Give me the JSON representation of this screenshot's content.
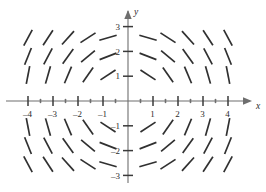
{
  "figure": {
    "kind": "slope-field",
    "axis_x_label": "x",
    "axis_y_label": "y",
    "line_color": "#303030",
    "axis_color": "#6e6e6e"
  },
  "chart_data": {
    "type": "scatter",
    "title": "",
    "xlabel": "x",
    "ylabel": "y",
    "xlim": [
      -4.7,
      4.7
    ],
    "ylim": [
      -3.4,
      3.4
    ],
    "grid": false,
    "legend": null,
    "xticks": [
      -4,
      -3,
      -2,
      -1,
      1,
      2,
      3,
      4
    ],
    "xtick_labels": [
      "–4",
      "–3",
      "–2",
      "–1",
      "1",
      "2",
      "3",
      "4"
    ],
    "yticks": [
      3,
      2,
      1,
      -1,
      -2,
      -3
    ],
    "ytick_labels": [
      "3",
      "2",
      "1",
      "–1",
      "–2",
      "–3"
    ],
    "minor_xticks": [
      -3.5,
      -2.5,
      -1.5,
      -0.5,
      0.5,
      1.5,
      2.5,
      3.5
    ],
    "field_x": [
      -4.0,
      -3.2,
      -2.4,
      -1.6,
      -0.8,
      0.8,
      1.6,
      2.4,
      3.2,
      4.0
    ],
    "field_y": [
      2.55,
      1.8,
      1.05,
      -1.05,
      -1.8,
      -2.55
    ],
    "slope_expression": "dy/dx = -x*y",
    "segment_length": 18,
    "segments": [
      {
        "x": -4.0,
        "y": 2.55,
        "angle_deg": -62
      },
      {
        "x": -3.2,
        "y": 2.55,
        "angle_deg": -57
      },
      {
        "x": -2.4,
        "y": 2.55,
        "angle_deg": -48
      },
      {
        "x": -1.6,
        "y": 2.55,
        "angle_deg": -33
      },
      {
        "x": -0.8,
        "y": 2.55,
        "angle_deg": -16
      },
      {
        "x": 0.8,
        "y": 2.55,
        "angle_deg": 16
      },
      {
        "x": 1.6,
        "y": 2.55,
        "angle_deg": 33
      },
      {
        "x": 2.4,
        "y": 2.55,
        "angle_deg": 48
      },
      {
        "x": 3.2,
        "y": 2.55,
        "angle_deg": 57
      },
      {
        "x": 4.0,
        "y": 2.55,
        "angle_deg": 62
      },
      {
        "x": -4.0,
        "y": 1.8,
        "angle_deg": -68
      },
      {
        "x": -3.2,
        "y": 1.8,
        "angle_deg": -62
      },
      {
        "x": -2.4,
        "y": 1.8,
        "angle_deg": -54
      },
      {
        "x": -1.6,
        "y": 1.8,
        "angle_deg": -40
      },
      {
        "x": -0.8,
        "y": 1.8,
        "angle_deg": -21
      },
      {
        "x": 0.8,
        "y": 1.8,
        "angle_deg": 21
      },
      {
        "x": 1.6,
        "y": 1.8,
        "angle_deg": 40
      },
      {
        "x": 2.4,
        "y": 1.8,
        "angle_deg": 54
      },
      {
        "x": 3.2,
        "y": 1.8,
        "angle_deg": 62
      },
      {
        "x": 4.0,
        "y": 1.8,
        "angle_deg": 68
      },
      {
        "x": -4.0,
        "y": 1.05,
        "angle_deg": -79
      },
      {
        "x": -3.2,
        "y": 1.05,
        "angle_deg": -74
      },
      {
        "x": -2.4,
        "y": 1.05,
        "angle_deg": -67
      },
      {
        "x": -1.6,
        "y": 1.05,
        "angle_deg": -55
      },
      {
        "x": -0.8,
        "y": 1.05,
        "angle_deg": -33
      },
      {
        "x": 0.8,
        "y": 1.05,
        "angle_deg": 33
      },
      {
        "x": 1.6,
        "y": 1.05,
        "angle_deg": 55
      },
      {
        "x": 2.4,
        "y": 1.05,
        "angle_deg": 67
      },
      {
        "x": 3.2,
        "y": 1.05,
        "angle_deg": 74
      },
      {
        "x": 4.0,
        "y": 1.05,
        "angle_deg": 79
      },
      {
        "x": -4.0,
        "y": -1.05,
        "angle_deg": 79
      },
      {
        "x": -3.2,
        "y": -1.05,
        "angle_deg": 74
      },
      {
        "x": -2.4,
        "y": -1.05,
        "angle_deg": 67
      },
      {
        "x": -1.6,
        "y": -1.05,
        "angle_deg": 55
      },
      {
        "x": -0.8,
        "y": -1.05,
        "angle_deg": 33
      },
      {
        "x": 0.8,
        "y": -1.05,
        "angle_deg": -33
      },
      {
        "x": 1.6,
        "y": -1.05,
        "angle_deg": -55
      },
      {
        "x": 2.4,
        "y": -1.05,
        "angle_deg": -67
      },
      {
        "x": 3.2,
        "y": -1.05,
        "angle_deg": -74
      },
      {
        "x": 4.0,
        "y": -1.05,
        "angle_deg": -79
      },
      {
        "x": -4.0,
        "y": -1.8,
        "angle_deg": 68
      },
      {
        "x": -3.2,
        "y": -1.8,
        "angle_deg": 62
      },
      {
        "x": -2.4,
        "y": -1.8,
        "angle_deg": 54
      },
      {
        "x": -1.6,
        "y": -1.8,
        "angle_deg": 40
      },
      {
        "x": -0.8,
        "y": -1.8,
        "angle_deg": 21
      },
      {
        "x": 0.8,
        "y": -1.8,
        "angle_deg": -21
      },
      {
        "x": 1.6,
        "y": -1.8,
        "angle_deg": -40
      },
      {
        "x": 2.4,
        "y": -1.8,
        "angle_deg": -54
      },
      {
        "x": 3.2,
        "y": -1.8,
        "angle_deg": -62
      },
      {
        "x": 4.0,
        "y": -1.8,
        "angle_deg": -68
      },
      {
        "x": -4.0,
        "y": -2.55,
        "angle_deg": 62
      },
      {
        "x": -3.2,
        "y": -2.55,
        "angle_deg": 57
      },
      {
        "x": -2.4,
        "y": -2.55,
        "angle_deg": 48
      },
      {
        "x": -1.6,
        "y": -2.55,
        "angle_deg": 33
      },
      {
        "x": -0.8,
        "y": -2.55,
        "angle_deg": 16
      },
      {
        "x": 0.8,
        "y": -2.55,
        "angle_deg": -16
      },
      {
        "x": 1.6,
        "y": -2.55,
        "angle_deg": -33
      },
      {
        "x": 2.4,
        "y": -2.55,
        "angle_deg": -48
      },
      {
        "x": 3.2,
        "y": -2.55,
        "angle_deg": -57
      },
      {
        "x": 4.0,
        "y": -2.55,
        "angle_deg": -62
      }
    ]
  }
}
